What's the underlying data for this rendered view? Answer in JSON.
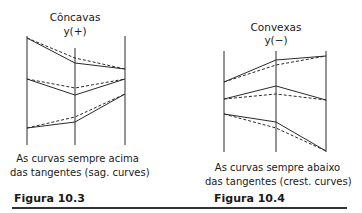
{
  "figures": [
    {
      "id": "10.3",
      "title": "Côncavas",
      "sign": "y(+)",
      "caption_line1": "As curvas sempre acima",
      "caption_line2": "das tangentes (sag. curves)",
      "label": "Figura 10.3"
    },
    {
      "id": "10.4",
      "title": "Convexas",
      "sign": "y(−)",
      "caption_line1": "As curvas sempre abaixo",
      "caption_line2": "das tangentes (crest. curves)",
      "label": "Figura 10.4"
    }
  ],
  "colors": {
    "line": "#2a2a2a",
    "rule": "#333333"
  }
}
